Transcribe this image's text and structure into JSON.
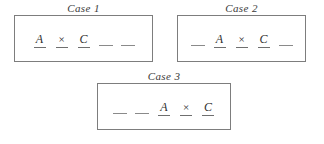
{
  "figure": {
    "name": "case-arrangements-figure",
    "background_color": "#ffffff",
    "line_color": "#7d7d7d",
    "text_color": "#2e2e2e"
  },
  "cases": [
    {
      "label": "Case 1",
      "slots": [
        {
          "text": "A",
          "kind": "letter",
          "underlined": true
        },
        {
          "text": "×",
          "kind": "operator",
          "underlined": true
        },
        {
          "text": "C",
          "kind": "letter",
          "underlined": true
        },
        {
          "text": "",
          "kind": "blank",
          "underlined": true
        },
        {
          "text": "",
          "kind": "blank",
          "underlined": true
        }
      ]
    },
    {
      "label": "Case 2",
      "slots": [
        {
          "text": "",
          "kind": "blank",
          "underlined": true
        },
        {
          "text": "A",
          "kind": "letter",
          "underlined": true
        },
        {
          "text": "×",
          "kind": "operator",
          "underlined": true
        },
        {
          "text": "C",
          "kind": "letter",
          "underlined": true
        },
        {
          "text": "",
          "kind": "blank",
          "underlined": true
        }
      ]
    },
    {
      "label": "Case 3",
      "slots": [
        {
          "text": "",
          "kind": "blank",
          "underlined": true
        },
        {
          "text": "",
          "kind": "blank",
          "underlined": true
        },
        {
          "text": "A",
          "kind": "letter",
          "underlined": true
        },
        {
          "text": "×",
          "kind": "operator",
          "underlined": true
        },
        {
          "text": "C",
          "kind": "letter",
          "underlined": true
        }
      ]
    }
  ]
}
